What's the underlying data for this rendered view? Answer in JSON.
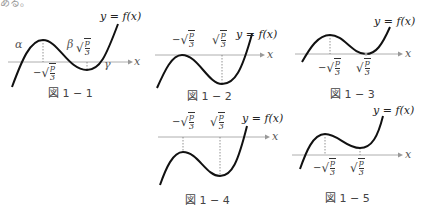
{
  "header_fragment": "ある。",
  "equation_label": "y = f(x)",
  "x_axis_label": "x",
  "sqrt_label": {
    "sign_neg": "−",
    "num": "p",
    "den": "3"
  },
  "colors": {
    "curve": "#111111",
    "axis": "#999999",
    "dotted": "#777777",
    "caption": "#444444"
  },
  "figures": [
    {
      "id": "1-1",
      "caption": "図 1 − 1",
      "labels": [
        "α",
        "β",
        "γ",
        "−√(p/3)",
        "√(p/3)"
      ]
    },
    {
      "id": "1-2",
      "caption": "図 1 − 2",
      "labels": [
        "−√(p/3)",
        "√(p/3)"
      ]
    },
    {
      "id": "1-3",
      "caption": "図 1 − 3",
      "labels": [
        "−√(p/3)",
        "√(p/3)"
      ]
    },
    {
      "id": "1-4",
      "caption": "図 1 − 4",
      "labels": [
        "−√(p/3)",
        "√(p/3)"
      ]
    },
    {
      "id": "1-5",
      "caption": "図 1 − 5",
      "labels": [
        "−√(p/3)",
        "√(p/3)"
      ]
    }
  ],
  "greek": {
    "alpha": "α",
    "beta": "β",
    "gamma": "γ"
  }
}
